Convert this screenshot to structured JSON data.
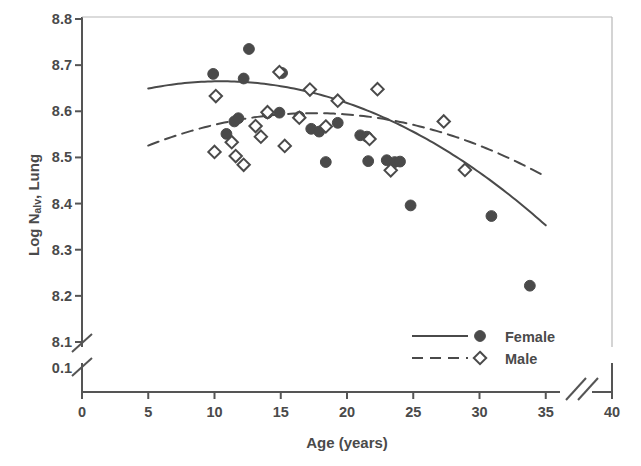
{
  "chart_data": {
    "type": "scatter",
    "title": "",
    "xlabel": "Age (years)",
    "ylabel": "Log Nalv, Lung",
    "ylabel_main": "Log N",
    "ylabel_sub": "alv",
    "ylabel_tail": ", Lung",
    "xlim": [
      0,
      40
    ],
    "ylim": [
      8.1,
      8.8
    ],
    "y_axis_break": true,
    "y_break_low_label": "0.1",
    "x_axis_break": true,
    "grid": false,
    "legend_position": "bottom-right",
    "xticks": [
      0,
      5,
      10,
      15,
      20,
      25,
      30,
      35,
      40
    ],
    "xtick_labels": [
      "0",
      "5",
      "10",
      "15",
      "20",
      "25",
      "30",
      "35",
      "40"
    ],
    "yticks": [
      8.1,
      8.2,
      8.3,
      8.4,
      8.5,
      8.6,
      8.7,
      8.8
    ],
    "ytick_labels": [
      "8.1",
      "8.2",
      "8.3",
      "8.4",
      "8.5",
      "8.6",
      "8.7",
      "8.8"
    ],
    "series": [
      {
        "name": "Female",
        "marker": "filled-circle",
        "line_style": "solid",
        "color": "#4a4a4a",
        "points": [
          {
            "x": 9.9,
            "y": 8.681
          },
          {
            "x": 10.9,
            "y": 8.551
          },
          {
            "x": 11.5,
            "y": 8.578
          },
          {
            "x": 11.8,
            "y": 8.585
          },
          {
            "x": 12.2,
            "y": 8.671
          },
          {
            "x": 12.6,
            "y": 8.735
          },
          {
            "x": 14.0,
            "y": 8.596
          },
          {
            "x": 14.9,
            "y": 8.597
          },
          {
            "x": 15.1,
            "y": 8.683
          },
          {
            "x": 16.4,
            "y": 8.588
          },
          {
            "x": 17.3,
            "y": 8.562
          },
          {
            "x": 17.9,
            "y": 8.556
          },
          {
            "x": 18.4,
            "y": 8.49
          },
          {
            "x": 19.3,
            "y": 8.575
          },
          {
            "x": 21.0,
            "y": 8.548
          },
          {
            "x": 21.5,
            "y": 8.545
          },
          {
            "x": 21.6,
            "y": 8.492
          },
          {
            "x": 23.0,
            "y": 8.494
          },
          {
            "x": 23.6,
            "y": 8.49
          },
          {
            "x": 24.0,
            "y": 8.491
          },
          {
            "x": 24.8,
            "y": 8.396
          },
          {
            "x": 30.9,
            "y": 8.373
          },
          {
            "x": 33.8,
            "y": 8.222
          }
        ],
        "fit_curve": {
          "type": "quadratic",
          "x_start": 5.0,
          "x_end": 35.0,
          "vertex_x": 10.5,
          "vertex_y": 8.665,
          "curvature": -0.00052
        }
      },
      {
        "name": "Male",
        "marker": "open-diamond",
        "line_style": "dashed",
        "color": "#4a4a4a",
        "points": [
          {
            "x": 10.0,
            "y": 8.512
          },
          {
            "x": 10.1,
            "y": 8.633
          },
          {
            "x": 11.3,
            "y": 8.533
          },
          {
            "x": 11.6,
            "y": 8.503
          },
          {
            "x": 12.2,
            "y": 8.484
          },
          {
            "x": 13.1,
            "y": 8.568
          },
          {
            "x": 13.5,
            "y": 8.545
          },
          {
            "x": 14.0,
            "y": 8.598
          },
          {
            "x": 14.9,
            "y": 8.685
          },
          {
            "x": 15.3,
            "y": 8.525
          },
          {
            "x": 16.4,
            "y": 8.586
          },
          {
            "x": 17.2,
            "y": 8.647
          },
          {
            "x": 18.4,
            "y": 8.567
          },
          {
            "x": 19.3,
            "y": 8.623
          },
          {
            "x": 21.7,
            "y": 8.54
          },
          {
            "x": 22.3,
            "y": 8.648
          },
          {
            "x": 23.3,
            "y": 8.472
          },
          {
            "x": 27.3,
            "y": 8.578
          },
          {
            "x": 28.9,
            "y": 8.473
          }
        ],
        "fit_curve": {
          "type": "quadratic",
          "x_start": 5.0,
          "x_end": 35.0,
          "vertex_x": 17.5,
          "vertex_y": 8.596,
          "curvature": -0.00045
        }
      }
    ]
  },
  "legend": {
    "entries": [
      {
        "label": "Female",
        "marker": "filled-circle",
        "line": "solid"
      },
      {
        "label": "Male",
        "marker": "open-diamond",
        "line": "dashed"
      }
    ]
  },
  "colors": {
    "ink": "#4a4a4a",
    "axis": "#555555",
    "background": "#ffffff"
  }
}
